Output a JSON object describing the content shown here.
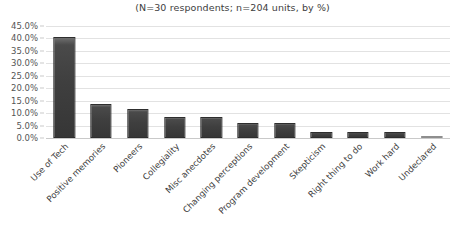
{
  "chart_data": {
    "type": "bar",
    "title": "(N=30 respondents; n=204 units, by %)",
    "xlabel": "",
    "ylabel": "",
    "ylim": [
      0,
      45
    ],
    "ytick_labels": [
      "45.0%",
      "40.0%",
      "35.0%",
      "30.0%",
      "25.0%",
      "20.0%",
      "15.0%",
      "10.0%",
      "5.0%",
      "0.0%"
    ],
    "ytick_values": [
      45,
      40,
      35,
      30,
      25,
      20,
      15,
      10,
      5,
      0
    ],
    "grid": true,
    "legend": "none",
    "categories": [
      "Use of Tech",
      "Positive memories",
      "Pioneers",
      "Collegiality",
      "Misc anecdotes",
      "Changing perceptions",
      "Program development",
      "Skepticism",
      "Right thing to do",
      "Work hard",
      "Undeclared"
    ],
    "values": [
      40.5,
      13.5,
      11.5,
      8.5,
      8.5,
      6.0,
      6.0,
      2.5,
      2.5,
      2.5,
      0.5
    ],
    "bar_color": "#3f3f3f",
    "gridline_color": "#e2e2e2"
  }
}
